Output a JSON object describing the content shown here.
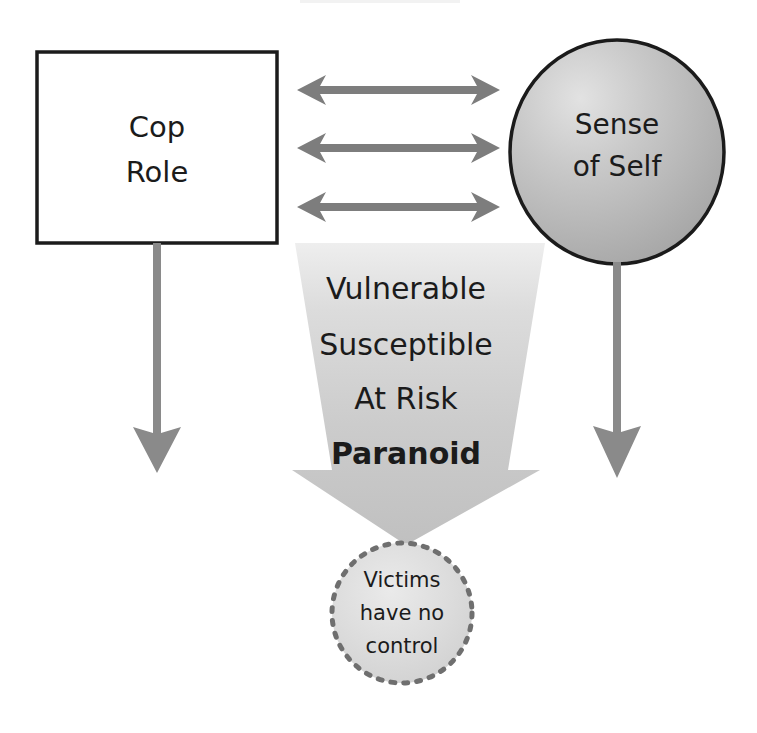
{
  "diagram": {
    "title_fragment": "",
    "background_color": "#ffffff",
    "nodes": [
      {
        "id": "cop-role",
        "shape": "rectangle",
        "lines": [
          "Cop",
          "Role"
        ],
        "fill": "#ffffff",
        "stroke": "#1b1b1b"
      },
      {
        "id": "sense-of-self",
        "shape": "ellipse",
        "lines": [
          "Sense",
          "of Self"
        ],
        "fill": "#b4b4b4",
        "stroke": "#1b1b1b"
      },
      {
        "id": "victims-have-no-control",
        "shape": "dotted-circle",
        "lines": [
          "Victims",
          "have no",
          "control"
        ],
        "fill": "#d9d9d9",
        "stroke": "#7a7a7a"
      }
    ],
    "funnel": {
      "id": "vulnerability-funnel",
      "shape": "down-arrow",
      "fill": "#c4c4c4",
      "lines": [
        {
          "text": "Vulnerable",
          "bold": false
        },
        {
          "text": "Susceptible",
          "bold": false
        },
        {
          "text": "At Risk",
          "bold": false
        },
        {
          "text": "Paranoid",
          "bold": true
        }
      ]
    },
    "connectors": [
      {
        "id": "cop-sense-link-1",
        "kind": "double-arrow",
        "orientation": "horizontal",
        "color": "#7d7d7d"
      },
      {
        "id": "cop-sense-link-2",
        "kind": "double-arrow",
        "orientation": "horizontal",
        "color": "#7d7d7d"
      },
      {
        "id": "cop-sense-link-3",
        "kind": "double-arrow",
        "orientation": "horizontal",
        "color": "#7d7d7d"
      },
      {
        "id": "cop-role-down-arrow",
        "kind": "single-arrow",
        "orientation": "vertical-down",
        "color": "#8a8a8a"
      },
      {
        "id": "sense-of-self-down-arrow",
        "kind": "single-arrow",
        "orientation": "vertical-down",
        "color": "#8a8a8a"
      }
    ]
  }
}
